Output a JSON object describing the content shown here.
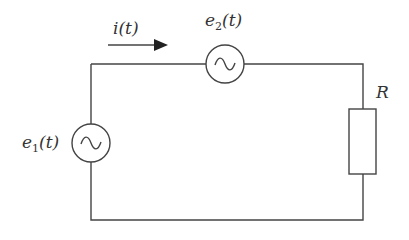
{
  "diagram": {
    "type": "circuit",
    "labels": {
      "current": "i(t)",
      "source2_base": "e",
      "source2_sub": "2",
      "source2_arg": "(t)",
      "source1_base": "e",
      "source1_sub": "1",
      "source1_arg": "(t)",
      "resistor": "R"
    },
    "components": [
      {
        "id": "e1",
        "kind": "ac-voltage-source",
        "label": "e1(t)",
        "position": "left branch"
      },
      {
        "id": "e2",
        "kind": "ac-voltage-source",
        "label": "e2(t)",
        "position": "top branch"
      },
      {
        "id": "R",
        "kind": "resistor",
        "label": "R",
        "position": "right branch"
      }
    ],
    "current_arrow": {
      "label": "i(t)",
      "direction": "right"
    },
    "colors": {
      "wire": "#444444",
      "text": "#333333"
    }
  }
}
